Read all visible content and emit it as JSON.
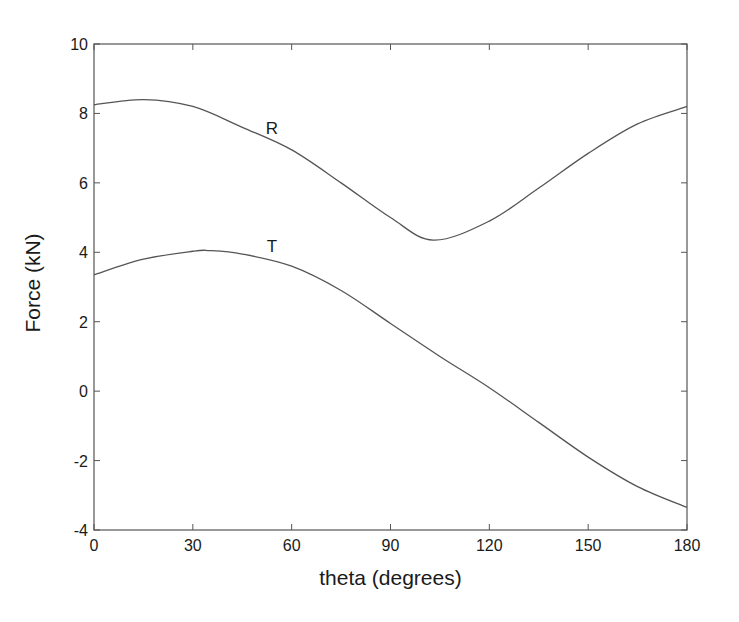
{
  "chart_data": {
    "type": "line",
    "title": "",
    "xlabel": "theta (degrees)",
    "ylabel": "Force (kN)",
    "xlim": [
      0,
      180
    ],
    "ylim": [
      -4,
      10
    ],
    "xticks": [
      0,
      30,
      60,
      90,
      120,
      150,
      180
    ],
    "yticks": [
      -4,
      -2,
      0,
      2,
      4,
      6,
      8,
      10
    ],
    "grid": false,
    "legend": "none (inline labels)",
    "series": [
      {
        "name": "R",
        "label_position": {
          "x": 54,
          "y": 7.6
        },
        "x": [
          0,
          15,
          30,
          45,
          60,
          75,
          90,
          103,
          120,
          135,
          150,
          165,
          180
        ],
        "values": [
          8.25,
          8.4,
          8.2,
          7.6,
          6.95,
          6.0,
          5.0,
          4.35,
          4.9,
          5.85,
          6.85,
          7.7,
          8.2
        ]
      },
      {
        "name": "T",
        "label_position": {
          "x": 54,
          "y": 4.2
        },
        "x": [
          0,
          15,
          30,
          35,
          45,
          60,
          75,
          90,
          105,
          120,
          135,
          150,
          165,
          180
        ],
        "values": [
          3.35,
          3.8,
          4.03,
          4.05,
          3.95,
          3.6,
          2.9,
          1.95,
          1.0,
          0.1,
          -0.9,
          -1.9,
          -2.75,
          -3.35
        ]
      }
    ],
    "colors": {
      "line": "#555555",
      "axes": "#555555",
      "text": "#1a1a1a",
      "background": "#ffffff"
    }
  }
}
